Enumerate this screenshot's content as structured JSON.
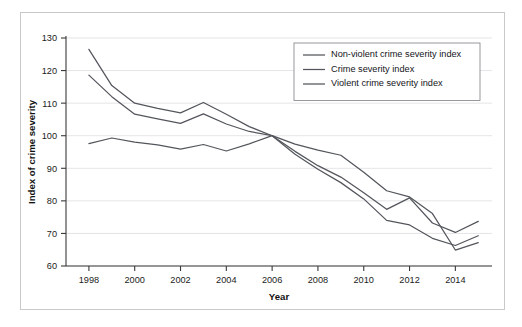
{
  "figure": {
    "border_color": "#c9c9c9",
    "background": "#ffffff"
  },
  "chart_data": {
    "type": "line",
    "title": "",
    "xlabel": "Year",
    "ylabel": "Index of crime severity",
    "xlim": [
      1997,
      2015.6
    ],
    "ylim": [
      60,
      130
    ],
    "ytick_step": 10,
    "xtick_step": 2,
    "grid": true,
    "grid_axis": "y",
    "legend_position": "top-right",
    "line_color": "#53565c",
    "x": [
      1998,
      1999,
      2000,
      2001,
      2002,
      2003,
      2004,
      2005,
      2006,
      2007,
      2008,
      2009,
      2010,
      2011,
      2012,
      2013,
      2014,
      2015
    ],
    "xtick_labels": [
      "1998",
      "2000",
      "2002",
      "2004",
      "2006",
      "2008",
      "2010",
      "2012",
      "2014"
    ],
    "ytick_labels": [
      "60",
      "70",
      "80",
      "90",
      "100",
      "110",
      "120",
      "130"
    ],
    "series": [
      {
        "name": "Non-violent crime severity index",
        "values": [
          126.5,
          115.4,
          110.0,
          108.4,
          107.0,
          110.2,
          106.6,
          102.8,
          100.0,
          95.2,
          90.8,
          87.3,
          82.5,
          77.4,
          80.9,
          73.2,
          70.3,
          73.7
        ]
      },
      {
        "name": "Crime severity index",
        "values": [
          118.6,
          112.0,
          106.6,
          105.2,
          103.8,
          106.7,
          103.6,
          101.3,
          100.0,
          94.3,
          89.7,
          85.6,
          80.6,
          74.0,
          72.6,
          68.5,
          66.3,
          69.3
        ]
      },
      {
        "name": "Violent crime severity index",
        "values": [
          97.6,
          99.3,
          98.0,
          97.2,
          95.9,
          97.3,
          95.3,
          97.5,
          100.0,
          97.4,
          95.6,
          94.0,
          88.8,
          83.1,
          81.2,
          76.1,
          64.9,
          67.2
        ]
      }
    ]
  },
  "legend": {
    "items": [
      {
        "label": "Non-violent crime severity index"
      },
      {
        "label": "Crime severity index"
      },
      {
        "label": "Violent crime severity index"
      }
    ]
  }
}
